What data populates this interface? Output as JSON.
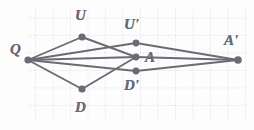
{
  "figure": {
    "background_color": "#fdfdfd",
    "grid": {
      "visible": true,
      "style": "dotted",
      "color": "#c9c9cf",
      "spacing_px": 17.5,
      "x0": 27,
      "y0": 6,
      "x1": 247,
      "y1": 122
    },
    "stroke_color": "#6b6b73",
    "point_color": "#6b6b73",
    "points": [
      {
        "id": "Q",
        "label": "Q",
        "x": 28,
        "y": 60,
        "label_x": 10,
        "label_y": 42,
        "r": 3.6
      },
      {
        "id": "U",
        "label": "U",
        "x": 82,
        "y": 37,
        "label_x": 75,
        "label_y": 8,
        "r": 3.6
      },
      {
        "id": "D",
        "label": "D",
        "x": 82,
        "y": 89,
        "label_x": 75,
        "label_y": 100,
        "r": 3.6
      },
      {
        "id": "Up",
        "label": "U'",
        "x": 136,
        "y": 43,
        "label_x": 124,
        "label_y": 17,
        "r": 3.4
      },
      {
        "id": "A",
        "label": "A",
        "x": 136,
        "y": 57,
        "label_x": 145,
        "label_y": 50,
        "r": 3.4
      },
      {
        "id": "Dp",
        "label": "D'",
        "x": 136,
        "y": 71,
        "label_x": 124,
        "label_y": 78,
        "r": 3.4
      },
      {
        "id": "Ap",
        "label": "A'",
        "x": 238,
        "y": 60,
        "label_x": 224,
        "label_y": 33,
        "r": 3.8
      }
    ],
    "segments": [
      {
        "from": "Q",
        "to": "U",
        "name": "segment-q-u"
      },
      {
        "from": "Q",
        "to": "D",
        "name": "segment-q-d"
      },
      {
        "from": "U",
        "to": "A",
        "name": "segment-u-a"
      },
      {
        "from": "D",
        "to": "A",
        "name": "segment-d-a"
      },
      {
        "from": "Q",
        "to": "Up",
        "name": "segment-q-uprime"
      },
      {
        "from": "Q",
        "to": "Dp",
        "name": "segment-q-dprime"
      },
      {
        "from": "Q",
        "to": "A",
        "name": "segment-q-a"
      },
      {
        "from": "Up",
        "to": "Ap",
        "name": "segment-uprime-aprime"
      },
      {
        "from": "Dp",
        "to": "Ap",
        "name": "segment-dprime-aprime"
      },
      {
        "from": "A",
        "to": "Ap",
        "name": "segment-a-aprime"
      }
    ]
  }
}
